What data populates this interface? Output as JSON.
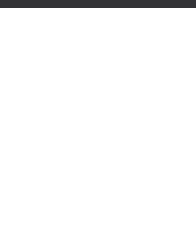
{
  "page": {
    "background_color": "#ffffff",
    "top_band_color": "#333336"
  },
  "fret_label": "6 fr",
  "chart_data": {
    "type": "scatter",
    "subtitle": "",
    "xlabel": "",
    "ylabel": "",
    "grid": true,
    "legend": "none",
    "notation": "guitar fretboard diagram",
    "strings": 6,
    "frets": 5,
    "starting_fret_label": "6 fr",
    "string_labels": [
      "1",
      "2",
      "3",
      "4",
      "5",
      "6"
    ],
    "fret_row_labels": [
      "6",
      "7",
      "8",
      "9",
      "10"
    ],
    "marker_types": {
      "filled-circle": "scale tone",
      "open-square": "root note"
    },
    "series": [
      {
        "name": "filled-circle",
        "marker": "filled-circle",
        "color": "#303034",
        "points": [
          {
            "string": 1,
            "fret_row": 1
          },
          {
            "string": 3,
            "fret_row": 1
          },
          {
            "string": 5,
            "fret_row": 1
          },
          {
            "string": 6,
            "fret_row": 1
          },
          {
            "string": 4,
            "fret_row": 2
          },
          {
            "string": 5,
            "fret_row": 2
          },
          {
            "string": 1,
            "fret_row": 3
          },
          {
            "string": 2,
            "fret_row": 3
          },
          {
            "string": 3,
            "fret_row": 3
          },
          {
            "string": 6,
            "fret_row": 3
          },
          {
            "string": 2,
            "fret_row": 4
          },
          {
            "string": 5,
            "fret_row": 4
          },
          {
            "string": 1,
            "fret_row": 5
          },
          {
            "string": 3,
            "fret_row": 5
          },
          {
            "string": 6,
            "fret_row": 5
          }
        ]
      },
      {
        "name": "open-square",
        "marker": "open-square",
        "color": "#4a4a4e",
        "points": [
          {
            "string": 2,
            "fret_row": 1
          },
          {
            "string": 4,
            "fret_row": 3
          }
        ]
      }
    ],
    "geometry": {
      "string_x": [
        18,
        47,
        76,
        105,
        134,
        162
      ],
      "fret_y": [
        32,
        69,
        105,
        142,
        179,
        222
      ],
      "row_center_y": [
        54,
        90,
        126,
        162,
        203
      ]
    }
  }
}
